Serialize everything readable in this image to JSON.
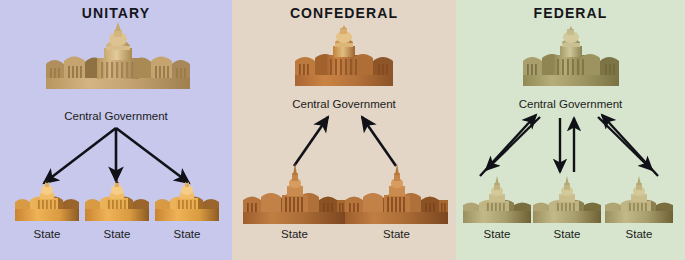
{
  "diagram": {
    "title_hidden": "",
    "panels": [
      {
        "id": "unitary",
        "title": "UNITARY",
        "bg_color": "#c7c8ec",
        "central": {
          "label": "Central Government",
          "building_color": "#c9a877",
          "building_shadow": "#a2814f"
        },
        "states": [
          {
            "label": "State",
            "building_color": "#dd9a3e"
          },
          {
            "label": "State",
            "building_color": "#dd9a3e"
          },
          {
            "label": "State",
            "building_color": "#dd9a3e"
          }
        ],
        "arrow_direction": "central-to-states",
        "arrow_count": 3
      },
      {
        "id": "confederal",
        "title": "CONFEDERAL",
        "bg_color": "#e3d6c6",
        "central": {
          "label": "Central Government",
          "building_color": "#c07b3c",
          "building_shadow": "#96582a"
        },
        "states": [
          {
            "label": "State",
            "building_color": "#b5723a"
          },
          {
            "label": "State",
            "building_color": "#b5723a"
          }
        ],
        "arrow_direction": "states-to-central",
        "arrow_count": 2
      },
      {
        "id": "federal",
        "title": "FEDERAL",
        "bg_color": "#d7e5ce",
        "central": {
          "label": "Central Government",
          "building_color": "#a8a06a",
          "building_shadow": "#847c4b"
        },
        "states": [
          {
            "label": "State",
            "building_color": "#b4a97c"
          },
          {
            "label": "State",
            "building_color": "#b4a97c"
          },
          {
            "label": "State",
            "building_color": "#b4a97c"
          }
        ],
        "arrow_direction": "bidirectional",
        "arrow_count": 6
      }
    ],
    "colors": {
      "arrow": "#111118",
      "title_text": "#15151b",
      "label_text": "#1b1b20"
    }
  }
}
